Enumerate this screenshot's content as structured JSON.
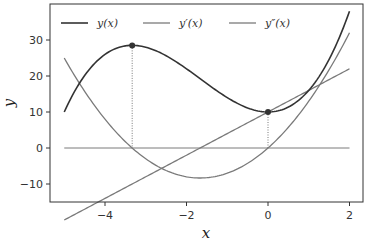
{
  "chart_data": {
    "type": "line",
    "title": "",
    "xlabel": "x",
    "ylabel": "y",
    "xlim": [
      -5.25,
      2.35
    ],
    "ylim": [
      -15,
      39
    ],
    "grid": false,
    "legend_position": "upper center (inside, horizontal)",
    "xticks": [
      -4,
      -2,
      0,
      2
    ],
    "xtick_labels": [
      "−4",
      "−2",
      "0",
      "2"
    ],
    "yticks": [
      -10,
      0,
      10,
      20,
      30
    ],
    "ytick_labels": [
      "−10",
      "0",
      "10",
      "20",
      "30"
    ],
    "series": [
      {
        "name": "y(x)",
        "legend_label": "y(x)",
        "expression": "x^3 + 5x^2 + 10",
        "color": "#333333",
        "x_range": [
          -5,
          2
        ]
      },
      {
        "name": "y'(x)",
        "legend_label": "y′(x)",
        "expression": "3x^2 + 10x",
        "color": "#7a7a7a",
        "x_range": [
          -5,
          2
        ]
      },
      {
        "name": "y''(x)",
        "legend_label": "y″(x)",
        "expression": "6x + 10",
        "color": "#7a7a7a",
        "x_range": [
          -5,
          2
        ]
      }
    ],
    "reference_lines": [
      {
        "type": "horizontal",
        "y": 0,
        "x_range": [
          -5,
          2
        ],
        "color": "#7a7a7a"
      }
    ],
    "markers": [
      {
        "label": "local maximum",
        "x": -3.333,
        "y": 28.5,
        "drop_line_to": 0
      },
      {
        "label": "local minimum",
        "x": 0,
        "y": 10,
        "drop_line_to": 0
      }
    ],
    "sample_points": {
      "y": {
        "x": [
          -5,
          -4,
          -3.333,
          -2,
          -1,
          0,
          1,
          2
        ],
        "values": [
          10,
          26,
          28.5,
          22,
          14,
          10,
          16,
          38
        ]
      },
      "y1": {
        "x": [
          -5,
          -4,
          -3.333,
          -1.667,
          0,
          1,
          2
        ],
        "values": [
          25,
          8,
          0,
          -8.33,
          0,
          13,
          32
        ]
      },
      "y2": {
        "x": [
          -5,
          -1.667,
          0,
          2
        ],
        "values": [
          -20,
          0,
          10,
          22
        ]
      }
    }
  }
}
